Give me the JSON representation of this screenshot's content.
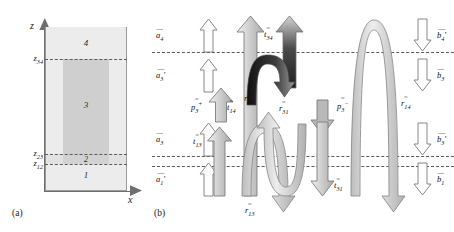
{
  "figure": {
    "panel_a": {
      "tag": "(a)",
      "axis_y_label": "z",
      "axis_x_label": "x",
      "layer_numbers": [
        "1",
        "2",
        "3",
        "4"
      ],
      "interface_labels": [
        "z12",
        "z23",
        "z34"
      ],
      "interface_labels_display": [
        {
          "base": "z",
          "sub": "12"
        },
        {
          "base": "z",
          "sub": "23"
        },
        {
          "base": "z",
          "sub": "34"
        }
      ],
      "colors": {
        "cladding": "#ececec",
        "core": "#cfcfcf",
        "layer2": "#d8d8d8",
        "outline": "#8a8a8a",
        "dashed": "#5a5a5a"
      }
    },
    "panel_b": {
      "tag": "(b)",
      "arrows": [
        {
          "name": "a4",
          "base": "a",
          "sub": "4",
          "accent": "bar",
          "prime": false,
          "dir": "up",
          "style": "outline"
        },
        {
          "name": "a3p",
          "base": "a",
          "sub": "3",
          "accent": "bar",
          "prime": true,
          "dir": "up",
          "style": "outline"
        },
        {
          "name": "a3",
          "base": "a",
          "sub": "3",
          "accent": "bar",
          "prime": false,
          "dir": "up",
          "style": "outline"
        },
        {
          "name": "a1p",
          "base": "a",
          "sub": "1",
          "accent": "bar",
          "prime": true,
          "dir": "up",
          "style": "outline"
        },
        {
          "name": "t14",
          "base": "t",
          "sub": "14",
          "accent": "dbar",
          "prime": false,
          "dir": "up",
          "style": "tall-gray"
        },
        {
          "name": "t34",
          "base": "t",
          "sub": "34",
          "accent": "dbar",
          "prime": false,
          "dir": "up",
          "style": "gradient-dark"
        },
        {
          "name": "p3plus",
          "base": "p",
          "sub": "3",
          "accent": "dbar",
          "prime": false,
          "sup": "+",
          "dir": "up",
          "style": "gray"
        },
        {
          "name": "t13",
          "base": "t",
          "sub": "13",
          "accent": "dbar",
          "prime": false,
          "dir": "up",
          "style": "gray"
        },
        {
          "name": "r34",
          "base": "r",
          "sub": "34",
          "accent": "dbar",
          "prime": false,
          "dir": "arch-down",
          "style": "dark"
        },
        {
          "name": "r13",
          "base": "r",
          "sub": "13",
          "accent": "dbar",
          "prime": false,
          "dir": "arch-down",
          "style": "gray"
        },
        {
          "name": "r31",
          "base": "r",
          "sub": "31",
          "accent": "dbar",
          "prime": false,
          "dir": "u-turn-up",
          "style": "gray"
        },
        {
          "name": "p3minus",
          "base": "p",
          "sub": "3",
          "accent": "dbar",
          "prime": false,
          "sup": "−",
          "dir": "down",
          "style": "gray-solid"
        },
        {
          "name": "t31",
          "base": "t",
          "sub": "31",
          "accent": "dbar",
          "prime": false,
          "dir": "down",
          "style": "gray"
        },
        {
          "name": "r14",
          "base": "r",
          "sub": "14",
          "accent": "tbar",
          "prime": false,
          "dir": "arch-down",
          "style": "gray"
        },
        {
          "name": "b4p",
          "base": "b",
          "sub": "4",
          "accent": "bar",
          "prime": true,
          "dir": "down",
          "style": "outline"
        },
        {
          "name": "b3",
          "base": "b",
          "sub": "3",
          "accent": "bar",
          "prime": false,
          "dir": "down",
          "style": "outline"
        },
        {
          "name": "b3p",
          "base": "b",
          "sub": "3",
          "accent": "bar",
          "prime": true,
          "dir": "down",
          "style": "outline"
        },
        {
          "name": "b1",
          "base": "b",
          "sub": "1",
          "accent": "bar",
          "prime": false,
          "dir": "down",
          "style": "outline"
        }
      ],
      "labels": {
        "a4": "a4",
        "a3p": "a3'",
        "a3": "a3",
        "a1p": "a1'",
        "t14": "t14",
        "t34": "t34",
        "t13": "t13",
        "t31": "t31",
        "p3plus": "p3+",
        "p3minus": "p3-",
        "r34": "r34",
        "r13": "r13",
        "r31": "r31",
        "r14": "r14",
        "b4p": "b4'",
        "b3": "b3",
        "b3p": "b3'",
        "b1": "b1"
      },
      "interface_count": 3,
      "colors": {
        "arrow_fill_light": "#fdfdfd",
        "arrow_fill_gray": "#c9c9c9",
        "arrow_fill_dark": "#2e2e2e",
        "arrow_stroke": "#6b6b6b",
        "dashed": "#5a5a5a"
      }
    }
  }
}
